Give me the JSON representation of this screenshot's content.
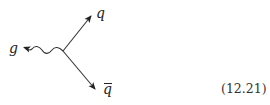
{
  "diagram": {
    "type": "feynman-vertex",
    "vertex": {
      "x": 63,
      "y": 51
    },
    "lines": [
      {
        "id": "gluon",
        "style": "wavy",
        "from": [
          63,
          51
        ],
        "to": [
          22,
          47
        ],
        "arrow": "end",
        "label": "g"
      },
      {
        "id": "quark",
        "style": "solid",
        "from": [
          63,
          51
        ],
        "to": [
          91,
          16
        ],
        "arrow": "end",
        "label": "q"
      },
      {
        "id": "antiquark",
        "style": "solid",
        "from": [
          63,
          51
        ],
        "to": [
          95,
          89
        ],
        "arrow": "end",
        "label": "q̄"
      }
    ],
    "labels": {
      "gluon": "g",
      "quark": "q",
      "antiquark": "q"
    },
    "line_color": "#333333"
  },
  "equation_number": "(12.21)"
}
